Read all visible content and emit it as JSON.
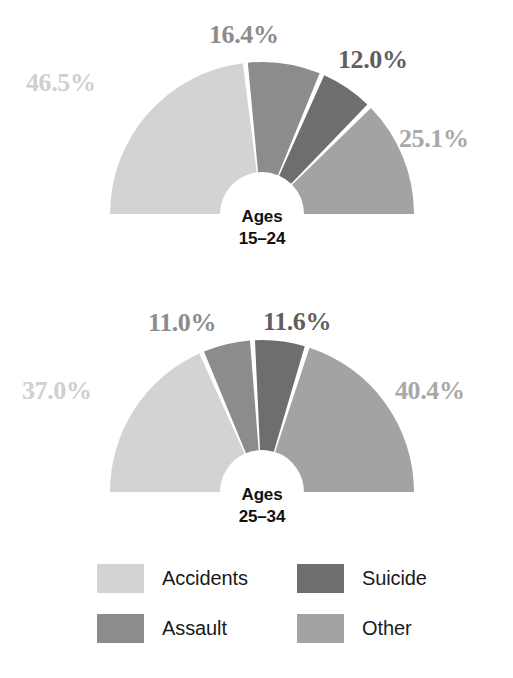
{
  "chart_data": {
    "type": "pie",
    "title": "",
    "subtitle": "",
    "variant": "half-donut",
    "grid": false,
    "legend_position": "bottom",
    "colors": {
      "accidents": "#d3d3d3",
      "assault": "#8c8c8c",
      "suicide": "#6e6e6e",
      "other": "#a3a3a3",
      "gap": "#ffffff",
      "center_text": "#111111"
    },
    "legend": [
      {
        "label": "Accidents",
        "color": "#d3d3d3"
      },
      {
        "label": "Suicide",
        "color": "#6e6e6e"
      },
      {
        "label": "Assault",
        "color": "#8c8c8c"
      },
      {
        "label": "Other",
        "color": "#a3a3a3"
      }
    ],
    "charts": [
      {
        "center_line1": "Ages",
        "center_line2": "15–24",
        "categories": [
          "Accidents",
          "Assault",
          "Suicide",
          "Other"
        ],
        "values": [
          46.5,
          16.4,
          12.0,
          25.1
        ],
        "labels": [
          "46.5%",
          "16.4%",
          "12.0%",
          "25.1%"
        ],
        "label_colors": [
          "#cfcfcf",
          "#8c8c8c",
          "#5f5f5f",
          "#a8a8a8"
        ]
      },
      {
        "center_line1": "Ages",
        "center_line2": "25–34",
        "categories": [
          "Accidents",
          "Assault",
          "Suicide",
          "Other"
        ],
        "values": [
          37.0,
          11.0,
          11.6,
          40.4
        ],
        "labels": [
          "37.0%",
          "11.0%",
          "11.6%",
          "40.4%"
        ],
        "label_colors": [
          "#cfcfcf",
          "#8c8c8c",
          "#5f5f5f",
          "#a8a8a8"
        ]
      }
    ]
  },
  "chart1": {
    "center_line1": "Ages",
    "center_line2": "15–24",
    "label_accidents": "46.5%",
    "label_assault": "16.4%",
    "label_suicide": "12.0%",
    "label_other": "25.1%"
  },
  "chart2": {
    "center_line1": "Ages",
    "center_line2": "25–34",
    "label_accidents": "37.0%",
    "label_assault": "11.0%",
    "label_suicide": "11.6%",
    "label_other": "40.4%"
  },
  "legend": {
    "accidents": "Accidents",
    "suicide": "Suicide",
    "assault": "Assault",
    "other": "Other"
  }
}
